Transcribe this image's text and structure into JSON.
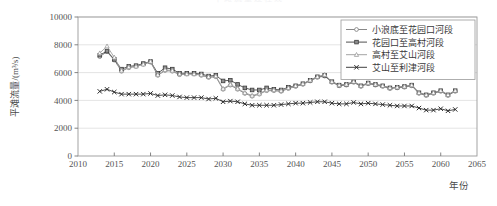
{
  "figure": {
    "top_caption_remnant": "平滩流量过程线",
    "background_color": "#ffffff",
    "plot_border_color": "#9a9a9a",
    "grid_color": "#d9d9d9"
  },
  "axes": {
    "y_label": "平滩流量/(m³/s)",
    "y_label_plain": "平滩流量/(m3/s)",
    "y_ticks": [
      "0",
      "2000",
      "4000",
      "6000",
      "8000",
      "10000"
    ],
    "x_label": "年份",
    "x_ticks": [
      "2010",
      "2015",
      "2020",
      "2025",
      "2030",
      "2035",
      "2040",
      "2045",
      "2050",
      "2055",
      "2060",
      "2065"
    ]
  },
  "legend": {
    "position": "top-right",
    "items": [
      {
        "label": "小浪底至花园口河段",
        "marker": "circle-open-marker",
        "color": "#7a7a7a"
      },
      {
        "label": "花园口至高村河段",
        "marker": "square-filled-marker",
        "color": "#3d3d3d"
      },
      {
        "label": "高村至艾山河段",
        "marker": "triangle-open-marker",
        "color": "#9b9b9b"
      },
      {
        "label": "艾山至利津河段",
        "marker": "cross-marker",
        "color": "#2b2b2b"
      }
    ]
  },
  "chart_data": {
    "type": "line",
    "title": "",
    "xlabel": "年份",
    "ylabel": "平滩流量/(m³/s)",
    "xlim": [
      2010,
      2065
    ],
    "ylim": [
      0,
      10000
    ],
    "grid": true,
    "legend_position": "top-right",
    "x": [
      2013,
      2014,
      2015,
      2016,
      2017,
      2018,
      2019,
      2020,
      2021,
      2022,
      2023,
      2024,
      2025,
      2026,
      2027,
      2028,
      2029,
      2030,
      2031,
      2032,
      2033,
      2034,
      2035,
      2036,
      2037,
      2038,
      2039,
      2040,
      2041,
      2042,
      2043,
      2044,
      2045,
      2046,
      2047,
      2048,
      2049,
      2050,
      2051,
      2052,
      2053,
      2054,
      2055,
      2056,
      2057,
      2058,
      2059,
      2060,
      2061,
      2062
    ],
    "series": [
      {
        "name": "小浪底至花园口河段",
        "marker": "circle-open-marker",
        "color": "#7a7a7a",
        "values": [
          7150,
          7500,
          6900,
          6100,
          6350,
          6450,
          6600,
          6750,
          5800,
          6150,
          6100,
          5850,
          5900,
          5900,
          5800,
          5650,
          5700,
          4800,
          5100,
          4800,
          4500,
          4300,
          4450,
          4700,
          4700,
          4650,
          4850,
          5000,
          5150,
          5400,
          5650,
          5750,
          5300,
          5050,
          5100,
          5300,
          5000,
          5200,
          5100,
          5000,
          4850,
          4900,
          4950,
          5050,
          4500,
          4350,
          4500,
          4650,
          4350,
          4650
        ]
      },
      {
        "name": "花园口至高村河段",
        "marker": "square-filled-marker",
        "color": "#3d3d3d",
        "values": [
          7250,
          7550,
          6950,
          6250,
          6450,
          6500,
          6650,
          6800,
          5950,
          6350,
          6250,
          5950,
          5950,
          5950,
          5900,
          5750,
          5800,
          5400,
          5450,
          5150,
          4900,
          4750,
          4750,
          4900,
          4800,
          4750,
          4950,
          5050,
          5200,
          5450,
          5700,
          5800,
          5350,
          5100,
          5150,
          5350,
          5050,
          5250,
          5150,
          5050,
          4900,
          4950,
          5000,
          5100,
          4550,
          4400,
          4550,
          4700,
          4400,
          4700
        ]
      },
      {
        "name": "高村至艾山河段",
        "marker": "triangle-open-marker",
        "color": "#9b9b9b",
        "values": [
          7400,
          7900,
          7100,
          6150,
          6400,
          6450,
          6600,
          6800,
          5850,
          6200,
          6150,
          5900,
          5900,
          5900,
          5850,
          5700,
          5750,
          4850,
          5150,
          4850,
          4550,
          4350,
          4500,
          4750,
          4750,
          4700,
          4900,
          5050,
          5200,
          5450,
          5700,
          5850,
          5350,
          5100,
          5150,
          5350,
          5050,
          5250,
          5150,
          5050,
          4900,
          4950,
          5000,
          5100,
          4550,
          4400,
          4550,
          4700,
          4400,
          4700
        ]
      },
      {
        "name": "艾山至利津河段",
        "marker": "cross-marker",
        "color": "#2b2b2b",
        "values": [
          4650,
          4800,
          4600,
          4450,
          4450,
          4450,
          4450,
          4500,
          4350,
          4400,
          4350,
          4250,
          4200,
          4200,
          4200,
          4100,
          4150,
          3900,
          3950,
          3900,
          3750,
          3650,
          3650,
          3650,
          3650,
          3700,
          3750,
          3800,
          3800,
          3850,
          3900,
          3900,
          3800,
          3750,
          3750,
          3850,
          3750,
          3800,
          3750,
          3700,
          3650,
          3600,
          3600,
          3600,
          3450,
          3300,
          3300,
          3400,
          3250,
          3350
        ]
      }
    ]
  }
}
